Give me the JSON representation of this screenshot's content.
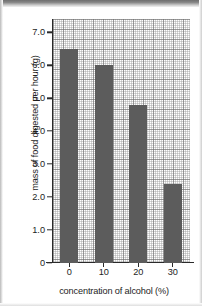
{
  "chart_data": {
    "type": "bar",
    "title": "",
    "subtitle": "",
    "xlabel": "concentration of alcohol (%)",
    "ylabel": "mass of food digested per hour (g)",
    "categories": [
      "0",
      "10",
      "20",
      "30"
    ],
    "values": [
      6.5,
      6.0,
      4.8,
      2.4
    ],
    "ylim": [
      0,
      7.4
    ],
    "yticks": [
      0,
      1.0,
      2.0,
      3.0,
      4.0,
      5.0,
      6.0,
      7.0
    ],
    "ytick_labels": [
      "0",
      "1.0",
      "2.0",
      "3.0",
      "4.0",
      "5.0",
      "6.0",
      "7.0"
    ],
    "xtick_labels": [
      "0",
      "10",
      "20",
      "30"
    ],
    "grid": true,
    "grid_style": "graph-paper",
    "legend": false,
    "legend_position": "none",
    "bar_color": "#5c5c5c",
    "axis_color": "#2a2a2a",
    "background_color": "#ffffff",
    "annotations": []
  }
}
